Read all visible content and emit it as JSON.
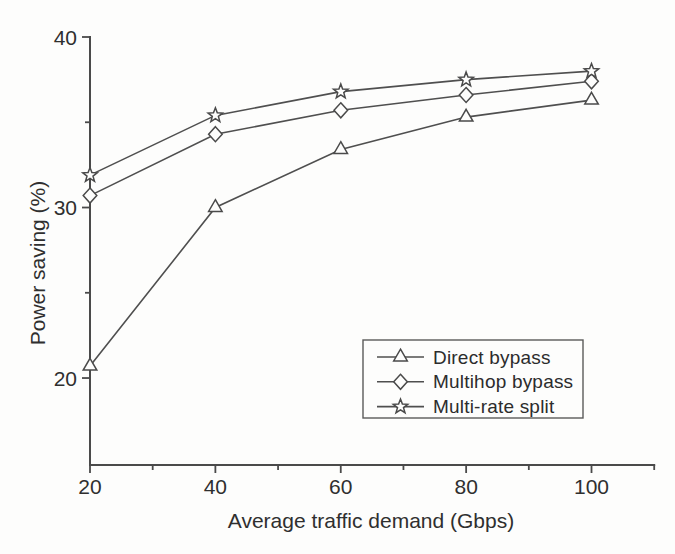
{
  "figure": {
    "kind": "scanned-line-chart"
  },
  "chart_data": {
    "type": "line",
    "title": "",
    "xlabel": "Average traffic demand (Gbps)",
    "ylabel": "Power saving (%)",
    "x": [
      20,
      40,
      60,
      80,
      100
    ],
    "series": [
      {
        "name": "Direct bypass",
        "marker": "triangle",
        "values": [
          20.7,
          30.0,
          33.4,
          35.3,
          36.3
        ]
      },
      {
        "name": "Multihop bypass",
        "marker": "diamond",
        "values": [
          30.7,
          34.3,
          35.7,
          36.6,
          37.4
        ]
      },
      {
        "name": "Multi-rate split",
        "marker": "star",
        "values": [
          31.9,
          35.4,
          36.8,
          37.5,
          38.0
        ]
      }
    ],
    "xlim": [
      20,
      110
    ],
    "ylim": [
      14.9,
      40
    ],
    "x_major_ticks": [
      20,
      40,
      60,
      80,
      100
    ],
    "x_minor_ticks": [
      30,
      50,
      70,
      90,
      110
    ],
    "y_major_ticks": [
      20,
      30,
      40
    ],
    "y_minor_ticks": [
      25,
      35
    ],
    "grid": false,
    "legend_position": "inside-lower-right",
    "line_color": "#4f4f4f",
    "text_color": "#2f2f2f",
    "background_color": "#fdfdfc"
  }
}
